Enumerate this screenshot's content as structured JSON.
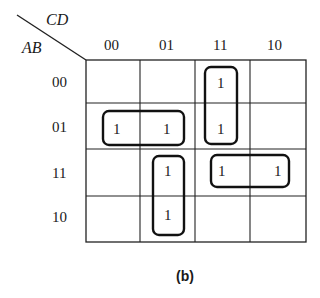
{
  "kmap": {
    "row_var": "AB",
    "col_var": "CD",
    "col_headers": [
      "00",
      "01",
      "11",
      "10"
    ],
    "row_headers": [
      "00",
      "01",
      "11",
      "10"
    ],
    "cells": [
      [
        "",
        "",
        "1",
        ""
      ],
      [
        "1",
        "1",
        "1",
        ""
      ],
      [
        "",
        "1",
        "1",
        "1"
      ],
      [
        "",
        "1",
        "",
        ""
      ]
    ],
    "groups": [
      {
        "name": "group-row01-cols00-01",
        "cells": [
          [
            1,
            0
          ],
          [
            1,
            1
          ]
        ]
      },
      {
        "name": "group-col11-rows00-01",
        "cells": [
          [
            0,
            2
          ],
          [
            1,
            2
          ]
        ]
      },
      {
        "name": "group-col01-rows11-10",
        "cells": [
          [
            2,
            1
          ],
          [
            3,
            1
          ]
        ]
      },
      {
        "name": "group-row11-cols11-10",
        "cells": [
          [
            2,
            2
          ],
          [
            2,
            3
          ]
        ]
      }
    ]
  },
  "caption": "(b)"
}
